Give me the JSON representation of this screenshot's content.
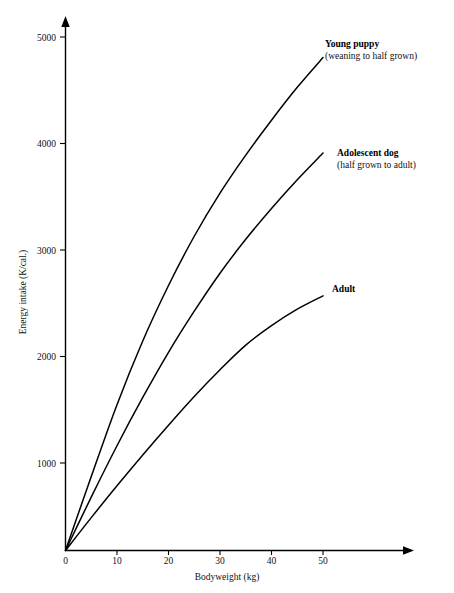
{
  "chart_data": {
    "type": "line",
    "title": "",
    "xlabel": "Bodyweight (kg)",
    "ylabel": "Energy intake  (K/cal.)",
    "xlim": [
      0,
      58
    ],
    "ylim": [
      0,
      5250
    ],
    "xticks": [
      0,
      10,
      20,
      30,
      40,
      50
    ],
    "xtick_labels": [
      "0",
      "10",
      "20",
      "30",
      "40",
      "50"
    ],
    "yticks": [
      1000,
      2000,
      3000,
      4000,
      5000
    ],
    "ytick_labels": [
      "1000",
      "2000",
      "3000",
      "4000",
      "5000"
    ],
    "grid": false,
    "legend_position": "inline-right-end-of-line",
    "series": [
      {
        "name": "Young puppy",
        "subtitle": "(weaning to half grown)",
        "x": [
          0,
          5,
          10,
          15,
          20,
          25,
          30,
          35,
          40,
          45,
          50
        ],
        "values": [
          0,
          720,
          1420,
          2040,
          2580,
          3060,
          3480,
          3850,
          4190,
          4510,
          4800
        ]
      },
      {
        "name": "Adolescent dog",
        "subtitle": "(half grown to adult)",
        "x": [
          0,
          5,
          10,
          15,
          20,
          25,
          30,
          35,
          40,
          45,
          50
        ],
        "values": [
          0,
          520,
          1020,
          1490,
          1930,
          2330,
          2700,
          3030,
          3330,
          3610,
          3870
        ]
      },
      {
        "name": "Adult",
        "subtitle": "",
        "x": [
          0,
          5,
          10,
          15,
          20,
          25,
          30,
          35,
          40,
          45,
          50
        ],
        "values": [
          0,
          320,
          630,
          930,
          1220,
          1500,
          1760,
          2000,
          2190,
          2350,
          2480
        ]
      }
    ]
  },
  "axes": {
    "y_axis_title": "Energy intake  (K/cal.)",
    "x_axis_title": "Bodyweight (kg)",
    "y_tick_1000": "1000",
    "y_tick_2000": "2000",
    "y_tick_3000": "3000",
    "y_tick_4000": "4000",
    "y_tick_5000": "5000",
    "x_tick_0": "0",
    "x_tick_10": "10",
    "x_tick_20": "20",
    "x_tick_30": "30",
    "x_tick_40": "40",
    "x_tick_50": "50"
  },
  "annotations": {
    "puppy_title": "Young puppy",
    "puppy_subtitle": "(weaning to half grown)",
    "adolescent_title": "Adolescent dog",
    "adolescent_subtitle": "(half grown to adult)",
    "adult_title": "Adult"
  },
  "colors": {
    "line": "#000000",
    "text": "#111111",
    "background": "#ffffff"
  }
}
